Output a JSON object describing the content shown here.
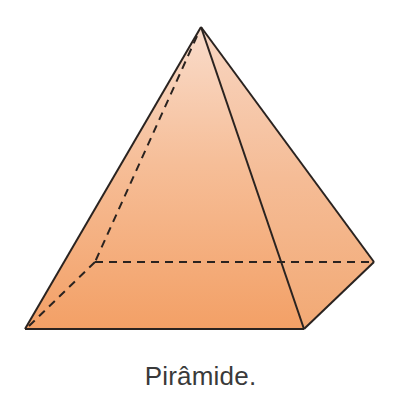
{
  "figure": {
    "shape": "square-pyramid",
    "caption": "Pirâmide.",
    "vertices": {
      "apex": [
        201,
        27
      ],
      "base_front_left": [
        25,
        329
      ],
      "base_front_right": [
        304,
        329
      ],
      "base_back_right": [
        374,
        262
      ],
      "base_back_left_hidden": [
        95,
        262
      ]
    },
    "colors": {
      "fill_top": "#F9DCCB",
      "fill_bottom": "#F3A066",
      "right_face_top": "#F8D6C2",
      "right_face_bottom": "#F2A974",
      "edge": "#2a2320",
      "caption": "#3a3a3a"
    }
  }
}
